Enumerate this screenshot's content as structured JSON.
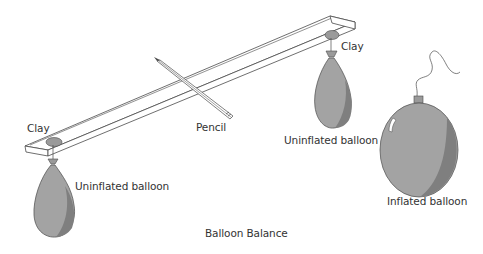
{
  "title": "Balloon Balance",
  "labels": {
    "clay_left": "Clay",
    "clay_right": "Clay",
    "pencil": "Pencil",
    "uninflated_left": "Uninflated balloon",
    "uninflated_right": "Uninflated balloon",
    "inflated": "Inflated balloon"
  },
  "colors": {
    "balloon_fill": "#a3a3a3",
    "balloon_shade": "#7f7f7f",
    "clay_fill": "#9a9a9a",
    "line": "#4a4a4a",
    "text": "#333333",
    "background": "#ffffff"
  }
}
